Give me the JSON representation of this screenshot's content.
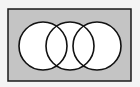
{
  "diagram": {
    "type": "venn",
    "universe": {
      "x": 8,
      "y": 9,
      "width": 123,
      "height": 72,
      "fill": "#c4c4c4",
      "stroke": "#1a1a1a"
    },
    "circles": [
      {
        "name": "set-a",
        "cx": 43,
        "cy": 46,
        "r": 24
      },
      {
        "name": "set-b",
        "cx": 70,
        "cy": 46,
        "r": 24
      },
      {
        "name": "set-c",
        "cx": 97,
        "cy": 46,
        "r": 24
      }
    ],
    "circle_fill": "#ffffff",
    "circle_stroke": "#111111"
  }
}
